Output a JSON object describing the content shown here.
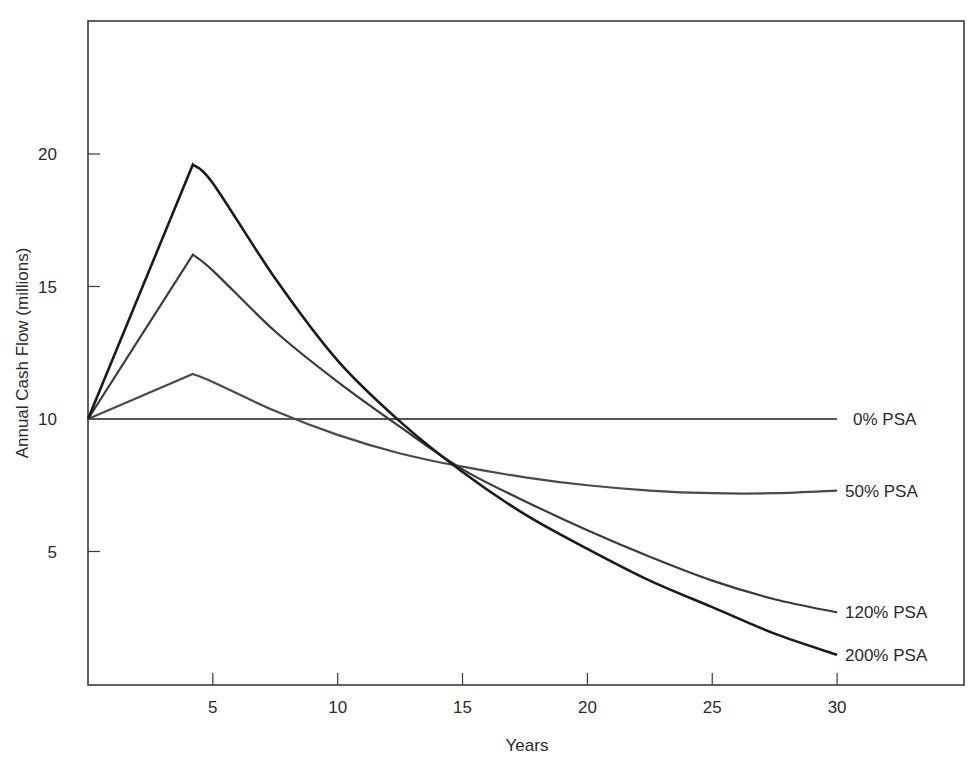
{
  "chart_data": {
    "type": "line",
    "title": "",
    "xlabel": "Years",
    "ylabel": "Annual Cash Flow (millions)",
    "xlim": [
      0,
      35
    ],
    "ylim": [
      1,
      24
    ],
    "x_ticks": [
      5,
      10,
      15,
      20,
      25,
      30
    ],
    "y_ticks": [
      5,
      10,
      15,
      20
    ],
    "grid": false,
    "legend_position": "inline-right",
    "x": [
      0,
      4.2,
      5,
      7.5,
      10,
      12.5,
      15,
      17.5,
      20,
      22.5,
      25,
      27.5,
      30
    ],
    "series": [
      {
        "name": "0% PSA",
        "label": "0% PSA",
        "color": "#555555",
        "values": [
          10,
          10,
          10,
          10,
          10,
          10,
          10,
          10,
          10,
          10,
          10,
          10,
          10
        ]
      },
      {
        "name": "50% PSA",
        "label": "50% PSA",
        "color": "#4a4a4a",
        "values": [
          10,
          11.7,
          11.4,
          10.3,
          9.4,
          8.7,
          8.2,
          7.8,
          7.5,
          7.3,
          7.2,
          7.2,
          7.3
        ]
      },
      {
        "name": "120% PSA",
        "label": "120% PSA",
        "color": "#3a3a3a",
        "values": [
          10,
          16.2,
          15.6,
          13.3,
          11.4,
          9.7,
          8.1,
          6.9,
          5.8,
          4.8,
          3.9,
          3.2,
          2.7
        ]
      },
      {
        "name": "200% PSA",
        "label": "200% PSA",
        "color": "#1a1a1a",
        "values": [
          10,
          19.6,
          18.9,
          15.3,
          12.2,
          9.9,
          8.0,
          6.4,
          5.1,
          3.9,
          2.9,
          1.9,
          1.1
        ]
      }
    ]
  }
}
